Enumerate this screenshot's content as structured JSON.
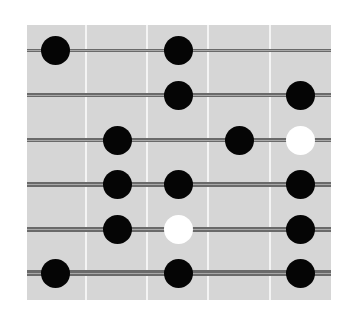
{
  "diagram": {
    "type": "fretboard-dot-chart",
    "board": {
      "color": "#d6d6d6",
      "fret_color": "#f4f4f4",
      "string_color": "#6a6a6a"
    },
    "frets_x": [
      86,
      147,
      208,
      270
    ],
    "strings": [
      {
        "y": 50,
        "thickness": 3
      },
      {
        "y": 95,
        "thickness": 4
      },
      {
        "y": 140,
        "thickness": 4
      },
      {
        "y": 184,
        "thickness": 5
      },
      {
        "y": 229,
        "thickness": 5
      },
      {
        "y": 273,
        "thickness": 6
      }
    ],
    "columns_x": [
      55,
      117,
      178,
      239,
      300
    ],
    "dots": [
      {
        "string": 1,
        "column": 1,
        "kind": "filled"
      },
      {
        "string": 1,
        "column": 3,
        "kind": "filled"
      },
      {
        "string": 2,
        "column": 3,
        "kind": "filled"
      },
      {
        "string": 2,
        "column": 5,
        "kind": "filled"
      },
      {
        "string": 3,
        "column": 2,
        "kind": "filled"
      },
      {
        "string": 3,
        "column": 4,
        "kind": "filled"
      },
      {
        "string": 3,
        "column": 5,
        "kind": "open"
      },
      {
        "string": 4,
        "column": 2,
        "kind": "filled"
      },
      {
        "string": 4,
        "column": 3,
        "kind": "filled"
      },
      {
        "string": 4,
        "column": 5,
        "kind": "filled"
      },
      {
        "string": 5,
        "column": 2,
        "kind": "filled"
      },
      {
        "string": 5,
        "column": 3,
        "kind": "open"
      },
      {
        "string": 5,
        "column": 5,
        "kind": "filled"
      },
      {
        "string": 6,
        "column": 1,
        "kind": "filled"
      },
      {
        "string": 6,
        "column": 3,
        "kind": "filled"
      },
      {
        "string": 6,
        "column": 5,
        "kind": "filled"
      }
    ]
  }
}
